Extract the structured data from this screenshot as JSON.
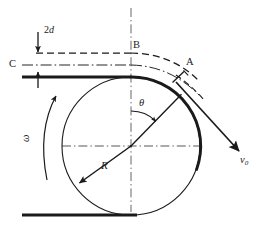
{
  "figure": {
    "background_color": "#ffffff",
    "stroke_color": "#1a1a1a",
    "width": 270,
    "height": 233
  },
  "labels": {
    "gap_number": "2",
    "gap_symbol": "d",
    "point_b": "B",
    "point_c": "C",
    "point_a": "A",
    "angle_theta": "θ",
    "angular_velocity": "ω",
    "radius": "R",
    "velocity_symbol": "v",
    "velocity_subscript": "0"
  },
  "geometry": {
    "circle": {
      "cx": 131,
      "cy": 146,
      "r": 69
    },
    "vertical_center_line": {
      "x": 131,
      "y1": 8,
      "y2": 212
    },
    "horizontal_center_line": {
      "y": 146,
      "x1": 64,
      "x2": 198
    },
    "top_surface_line": {
      "y": 77,
      "x1": 22,
      "x2": 131
    },
    "bottom_surface_line": {
      "y": 215,
      "x1": 22,
      "x2": 137
    },
    "dashed_upper_line": {
      "y": 53,
      "x1": 34,
      "x2": 131
    },
    "dashdot_mid_line": {
      "y": 65,
      "x1": 22,
      "x2": 131
    },
    "contact_angle_deg": 45
  },
  "annotations": {
    "theta_description": "angle from vertical to radius at point A",
    "omega_description": "counter-clockwise rotation arrow",
    "v0_description": "exit velocity vector directed down-right",
    "R_description": "radius arrow from centre to lower-left rim",
    "gap_description": "vertical gap 2d between dashed line and surface"
  }
}
